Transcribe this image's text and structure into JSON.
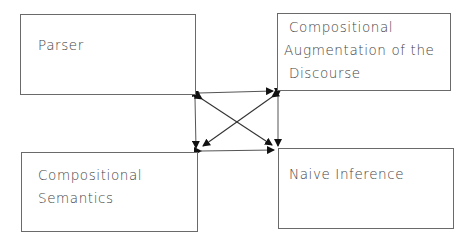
{
  "diagram": {
    "boxes": [
      {
        "id": "parser",
        "lines": [
          "Parser"
        ]
      },
      {
        "id": "augmentation",
        "lines": [
          "Compositional",
          "Augmentation of the",
          "Discourse"
        ]
      },
      {
        "id": "semantics",
        "lines": [
          "Compositional",
          "Semantics"
        ]
      },
      {
        "id": "inference",
        "lines": [
          "Naive Inference"
        ]
      }
    ],
    "connections": [
      {
        "from": "parser",
        "to": "augmentation",
        "type": "bidirectional"
      },
      {
        "from": "parser",
        "to": "semantics",
        "type": "bidirectional"
      },
      {
        "from": "parser",
        "to": "inference",
        "type": "bidirectional"
      },
      {
        "from": "augmentation",
        "to": "semantics",
        "type": "bidirectional"
      },
      {
        "from": "augmentation",
        "to": "inference",
        "type": "bidirectional"
      },
      {
        "from": "semantics",
        "to": "inference",
        "type": "bidirectional"
      }
    ],
    "colors": {
      "line": "#333333",
      "box_border": "#6a6a6a",
      "text": "#444444"
    }
  }
}
